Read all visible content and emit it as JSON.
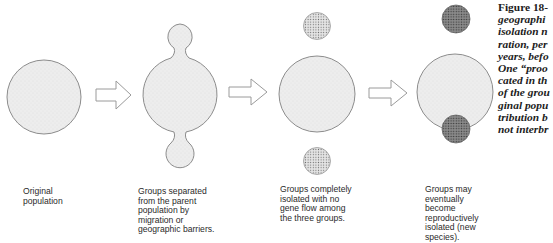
{
  "figure": {
    "label": "Figure 18-",
    "caption_lines": [
      "geographi",
      "isolation n",
      "ration, per",
      "years, befo",
      "One “proo",
      "cated in th",
      "of the grou",
      "ginal popu",
      "tribution b",
      "not interbr"
    ]
  },
  "stages": [
    {
      "id": "original",
      "caption": "Original\npopulation"
    },
    {
      "id": "separated",
      "caption": "Groups separated\nfrom the parent\npopulation by\nmigration or\ngeographic barriers."
    },
    {
      "id": "isolated",
      "caption": "Groups completely\nisolated with no\ngene flow among\nthe three groups."
    },
    {
      "id": "reproductive",
      "caption": "Groups may\neventually\nbecome\nreproductively\nisolated (new\nspecies)."
    }
  ],
  "colors": {
    "population_fill": "#ececec",
    "outline": "#8c8c8c",
    "light_group_fill": "#d9d9d9",
    "dark_group_fill": "#7a7a7a",
    "arrow_stroke": "#9a9a9a"
  }
}
